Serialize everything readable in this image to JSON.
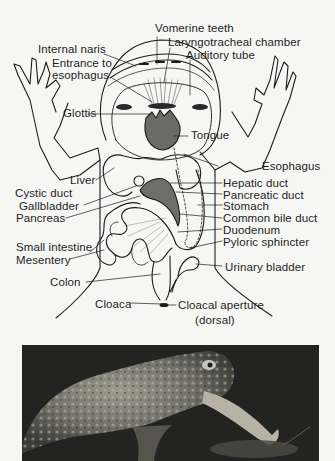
{
  "figure": {
    "labels": {
      "vomerine_teeth": "Vomerine teeth",
      "laryngotracheal_chamber": "Laryngotracheal chamber",
      "auditory_tube": "Auditory tube",
      "internal_naris": "Internal naris",
      "entrance_to": "Entrance to",
      "esophagus_entrance": "esophagus",
      "glottis": "Glottis",
      "tongue": "Tongue",
      "esophagus": "Esophagus",
      "liver": "Liver",
      "hepatic_duct": "Hepatic duct",
      "cystic_duct": "Cystic duct",
      "pancreatic_duct": "Pancreatic duct",
      "gallbladder": "Gallbladder",
      "stomach": "Stomach",
      "pancreas": "Pancreas",
      "common_bile_duct": "Common bile duct",
      "duodenum": "Duodenum",
      "small_intestine": "Small intestine",
      "pyloric_sphincter": "Pyloric sphincter",
      "mesentery": "Mesentery",
      "urinary_bladder": "Urinary bladder",
      "colon": "Colon",
      "cloaca": "Cloaca",
      "cloacal_aperture": "Cloacal aperture",
      "dorsal": "(dorsal)"
    }
  },
  "photo": {
    "subject": "Toad catching prey with extended tongue",
    "colors": {
      "background": "#1f1f1f",
      "toad_skin": "#8a8a7e",
      "tongue": "#b8b2a6"
    }
  },
  "colors": {
    "page_bg": "#f6f6f5",
    "line": "#1c1c1c",
    "text": "#1e1e1e"
  }
}
